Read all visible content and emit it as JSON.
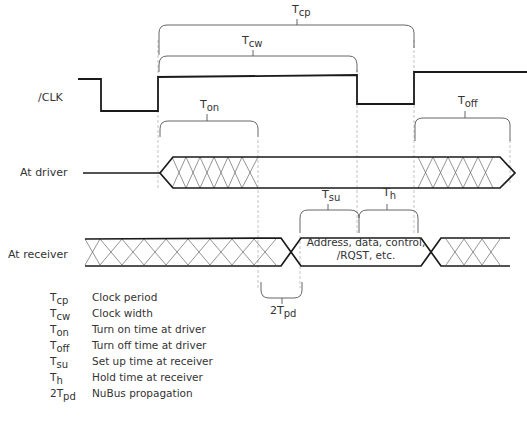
{
  "diagram": {
    "type": "timing-diagram",
    "signals": [
      {
        "id": "clk",
        "label": "/CLK"
      },
      {
        "id": "driver",
        "label": "At driver"
      },
      {
        "id": "receiver",
        "label": "At receiver"
      }
    ],
    "bus_text_line1": "Address, data, control,",
    "bus_text_line2": "/RQST, etc.",
    "intervals": {
      "tcp": {
        "base": "T",
        "sub": "cp"
      },
      "tcw": {
        "base": "T",
        "sub": "cw"
      },
      "ton": {
        "base": "T",
        "sub": "on"
      },
      "toff": {
        "base": "T",
        "sub": "off"
      },
      "tsu": {
        "base": "T",
        "sub": "su"
      },
      "th": {
        "base": "T",
        "sub": "h"
      },
      "tpd": {
        "base": "2T",
        "sub": "pd"
      }
    },
    "legend": [
      {
        "base": "T",
        "sub": "cp",
        "desc": "Clock period"
      },
      {
        "base": "T",
        "sub": "cw",
        "desc": "Clock width"
      },
      {
        "base": "T",
        "sub": "on",
        "desc": "Turn on time at driver"
      },
      {
        "base": "T",
        "sub": "off",
        "desc": "Turn off time at driver"
      },
      {
        "base": "T",
        "sub": "su",
        "desc": "Set up time at receiver"
      },
      {
        "base": "T",
        "sub": "h",
        "desc": "Hold time at receiver"
      },
      {
        "base": "2T",
        "sub": "pd",
        "desc": "NuBus propagation"
      }
    ],
    "colors": {
      "line": "#1a1a1a",
      "hatch": "#555555",
      "guide": "#999999"
    }
  }
}
